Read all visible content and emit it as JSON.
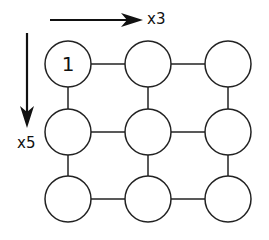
{
  "diagram": {
    "horizontal_arrow": {
      "label": "x3",
      "x1": 50,
      "x2": 143,
      "y": 20
    },
    "vertical_arrow": {
      "label": "x5",
      "x": 27,
      "y1": 33,
      "y2": 128
    },
    "grid": {
      "columns": [
        68,
        148,
        228
      ],
      "rows": [
        64,
        132,
        199
      ],
      "radius": 23,
      "nodes": [
        {
          "row": 0,
          "col": 0,
          "label": "1"
        },
        {
          "row": 0,
          "col": 1,
          "label": ""
        },
        {
          "row": 0,
          "col": 2,
          "label": ""
        },
        {
          "row": 1,
          "col": 0,
          "label": ""
        },
        {
          "row": 1,
          "col": 1,
          "label": ""
        },
        {
          "row": 1,
          "col": 2,
          "label": ""
        },
        {
          "row": 2,
          "col": 0,
          "label": ""
        },
        {
          "row": 2,
          "col": 1,
          "label": ""
        },
        {
          "row": 2,
          "col": 2,
          "label": ""
        }
      ]
    },
    "colors": {
      "stroke": "#222222",
      "fill": "#ffffff",
      "arrow": "#111111"
    }
  }
}
